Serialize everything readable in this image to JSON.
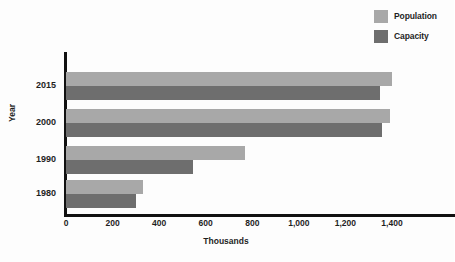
{
  "chart_data": {
    "type": "bar",
    "orientation": "horizontal",
    "title": "",
    "xlabel": "Thousands",
    "ylabel": "Year",
    "categories": [
      "2015",
      "2000",
      "1990",
      "1980"
    ],
    "series": [
      {
        "name": "Population",
        "color": "#a8a8a8",
        "values": [
          1400,
          1390,
          770,
          330
        ]
      },
      {
        "name": "Capacity",
        "color": "#6e6e6e",
        "values": [
          1350,
          1355,
          545,
          300
        ]
      }
    ],
    "xlim": [
      0,
      1400
    ],
    "xticks": [
      0,
      200,
      400,
      600,
      800,
      1000,
      1200,
      1400
    ],
    "xtick_labels": [
      "0",
      "200",
      "400",
      "600",
      "800",
      "1,000",
      "1,200",
      "1,400"
    ],
    "grid": false,
    "legend_position": "top-right",
    "legend_entries": [
      "Population",
      "Capacity"
    ]
  },
  "colors": {
    "population": "#a8a8a8",
    "capacity": "#6e6e6e",
    "axis": "#111111",
    "text": "#1f1f1f",
    "background": "#fdfdfd"
  }
}
